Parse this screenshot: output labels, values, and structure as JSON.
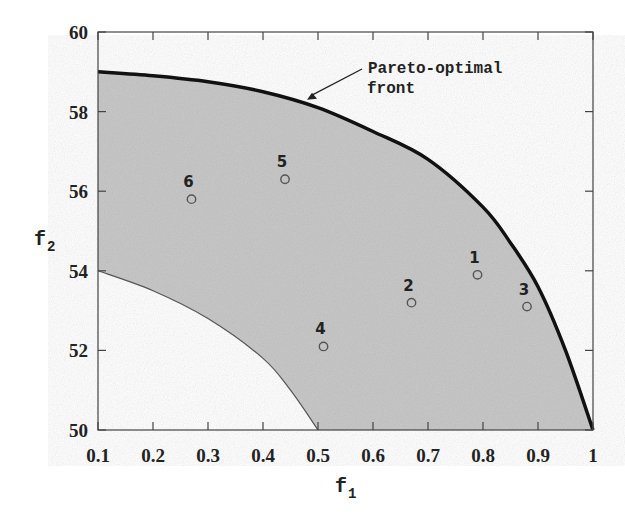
{
  "chart_data": {
    "type": "scatter",
    "title": "",
    "xlabel": "f1",
    "ylabel": "f2",
    "xlim": [
      0.1,
      1.0
    ],
    "ylim": [
      50,
      60
    ],
    "x_ticks": [
      "0.1",
      "0.2",
      "0.3",
      "0.4",
      "0.5",
      "0.6",
      "0.7",
      "0.8",
      "0.9",
      "1"
    ],
    "y_ticks": [
      "50",
      "52",
      "54",
      "56",
      "58",
      "60"
    ],
    "grid": false,
    "points": [
      {
        "label": "1",
        "x": 0.79,
        "y": 53.9
      },
      {
        "label": "2",
        "x": 0.67,
        "y": 53.2
      },
      {
        "label": "3",
        "x": 0.88,
        "y": 53.1
      },
      {
        "label": "4",
        "x": 0.51,
        "y": 52.1
      },
      {
        "label": "5",
        "x": 0.44,
        "y": 56.3
      },
      {
        "label": "6",
        "x": 0.27,
        "y": 55.8
      }
    ],
    "pareto_front": {
      "name": "Pareto-optimal front",
      "x": [
        0.1,
        0.2,
        0.3,
        0.4,
        0.5,
        0.6,
        0.7,
        0.8,
        0.85,
        0.9,
        0.95,
        1.0
      ],
      "y": [
        59.0,
        58.9,
        58.75,
        58.5,
        58.1,
        57.5,
        56.8,
        55.6,
        54.7,
        53.6,
        52.0,
        50.0
      ]
    },
    "feasible_lower_boundary": {
      "x": [
        0.1,
        0.2,
        0.3,
        0.4,
        0.45,
        0.5
      ],
      "y": [
        54.0,
        53.5,
        52.8,
        51.8,
        51.0,
        50.0
      ]
    },
    "annotations": [
      {
        "text_line1": "Pareto-optimal",
        "text_line2": "front",
        "arrow_to": [
          0.48,
          58.3
        ]
      }
    ],
    "colors": {
      "feasible_region": "#c8c8c8",
      "front": "#111111",
      "points": "#555555"
    }
  }
}
